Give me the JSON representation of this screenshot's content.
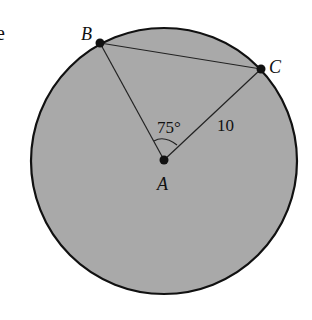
{
  "diagram": {
    "type": "circle-geometry",
    "background_color": "#ffffff",
    "circle": {
      "cx": 164,
      "cy": 161,
      "r": 133,
      "fill": "#a9a9a9",
      "stroke": "#111111"
    },
    "points": {
      "A": {
        "label": "A",
        "x": 164,
        "y": 160
      },
      "B": {
        "label": "B",
        "x": 100,
        "y": 43
      },
      "C": {
        "label": "C",
        "x": 261,
        "y": 69
      }
    },
    "angle_label": "75°",
    "side_label": "10",
    "cropped_text_fragment": "e"
  }
}
